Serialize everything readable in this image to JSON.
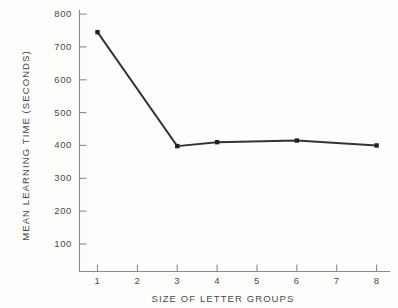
{
  "chart_data": {
    "type": "line",
    "title": "",
    "xlabel": "SIZE OF LETTER GROUPS",
    "ylabel": "MEAN LEARNING TIME (SECONDS)",
    "x": [
      1,
      3,
      4,
      6,
      8
    ],
    "values": [
      745,
      398,
      410,
      415,
      400
    ],
    "series": [
      {
        "name": "Mean learning time",
        "x": [
          1,
          3,
          4,
          6,
          8
        ],
        "values": [
          745,
          398,
          410,
          415,
          400
        ]
      }
    ],
    "xlim": [
      0,
      8.6
    ],
    "ylim": [
      0,
      830
    ],
    "xticks": [
      1,
      2,
      3,
      4,
      5,
      6,
      7,
      8
    ],
    "xtick_labels": [
      "1",
      "2",
      "3",
      "4",
      "5",
      "6",
      "7",
      "8"
    ],
    "yticks": [
      100,
      200,
      300,
      400,
      500,
      600,
      700,
      800
    ],
    "ytick_labels": [
      "100",
      "200",
      "300",
      "400",
      "500",
      "600",
      "700",
      "800"
    ],
    "grid": false,
    "legend": "none",
    "marker": "square",
    "line_color": "#333333",
    "marker_color": "#222222",
    "axis_color": "#8a8a8a",
    "background_color": "#fdfdfc"
  }
}
